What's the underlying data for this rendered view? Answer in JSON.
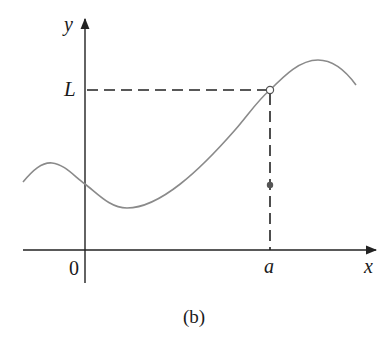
{
  "figure": {
    "caption": "(b)",
    "axis_labels": {
      "x": "x",
      "y": "y"
    },
    "origin_label": "0",
    "limit_label": "L",
    "point_label": "a"
  },
  "colors": {
    "axis": "#222222",
    "curve": "#8a8a8a",
    "dashed": "#222222",
    "point_fill": "#555555",
    "background": "#ffffff"
  },
  "geometry": {
    "description": "Graph of a function f(x) whose limit as x approaches a is L; open circle at (a, L), filled point at (a, f(a)) below L",
    "open_point": {
      "x": "a",
      "y": "L",
      "style": "open circle"
    },
    "filled_point": {
      "x": "a",
      "y": "f(a) < L",
      "style": "filled dot"
    }
  }
}
